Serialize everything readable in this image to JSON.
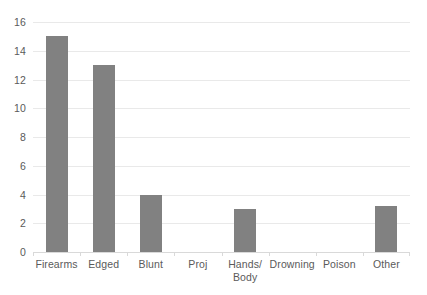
{
  "chart_data": {
    "type": "bar",
    "title": "",
    "subtitle": "",
    "xlabel": "",
    "ylabel": "",
    "categories": [
      "Firearms",
      "Edged",
      "Blunt",
      "Proj",
      "Hands/\nBody",
      "Drowning",
      "Poison",
      "Other"
    ],
    "values": [
      15,
      13,
      4,
      0,
      3,
      0,
      0,
      3.2
    ],
    "ylim": [
      0,
      16
    ],
    "ytick_labels": [
      "16",
      "14",
      "12",
      "10",
      "8",
      "6",
      "4",
      "2",
      "0"
    ],
    "ytick_values": [
      16,
      14,
      12,
      10,
      8,
      6,
      4,
      2,
      0
    ],
    "grid": true,
    "legend": false,
    "legend_position": "none",
    "colors": {
      "bar": "#818181",
      "gridline": "#e9e9e9",
      "axis": "#d9d9d9",
      "text": "#5a5a5a",
      "background": "#ffffff"
    }
  }
}
